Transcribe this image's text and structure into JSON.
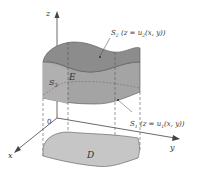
{
  "axes": {
    "x_label": "x",
    "y_label": "y",
    "z_label": "z",
    "origin_label": "0"
  },
  "regions": {
    "solid": "E",
    "base": "D",
    "side_surface": "S",
    "side_surface_sub": "3"
  },
  "surfaces": {
    "top": {
      "name": "S",
      "sub": "2",
      "eq_prefix": " (z = u",
      "eq_sub": "2",
      "eq_suffix": "(x, y))"
    },
    "bottom": {
      "name": "S",
      "sub": "1",
      "eq_prefix": " (z = u",
      "eq_sub": "1",
      "eq_suffix": "(x, y))"
    }
  },
  "colors": {
    "solid_fill": "#9a9a9a",
    "top_fill": "#8e8e8e",
    "side_fill": "#a6a6a6",
    "base_fill": "#c4c4c4",
    "line": "#4a4a4a"
  }
}
